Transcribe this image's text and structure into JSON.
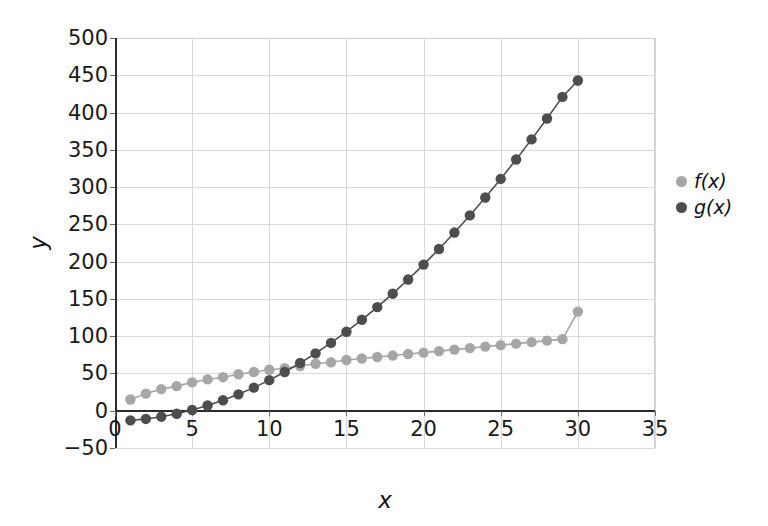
{
  "chart_data": {
    "type": "line",
    "title": "",
    "xlabel": "x",
    "ylabel": "y",
    "xlim": [
      0,
      35
    ],
    "ylim": [
      -50,
      500
    ],
    "xticks": [
      0,
      5,
      10,
      15,
      20,
      25,
      30,
      35
    ],
    "yticks": [
      -50,
      0,
      50,
      100,
      150,
      200,
      250,
      300,
      350,
      400,
      450,
      500
    ],
    "xtick_labels": [
      "0",
      "5",
      "10",
      "15",
      "20",
      "25",
      "30",
      "35"
    ],
    "ytick_labels": [
      "-50",
      "0",
      "50",
      "100",
      "150",
      "200",
      "250",
      "300",
      "350",
      "400",
      "450",
      "500"
    ],
    "grid": true,
    "legend_position": "right",
    "marker": "circle",
    "x": [
      1,
      2,
      3,
      4,
      5,
      6,
      7,
      8,
      9,
      10,
      11,
      12,
      13,
      14,
      15,
      16,
      17,
      18,
      19,
      20,
      21,
      22,
      23,
      24,
      25,
      26,
      27,
      28,
      29,
      30
    ],
    "series": [
      {
        "name": "f(x)",
        "color": "#a6a6a6",
        "values": [
          15,
          23,
          29,
          33,
          38,
          42,
          45,
          49,
          52,
          55,
          57,
          60,
          63,
          65,
          68,
          70,
          72,
          74,
          76,
          78,
          80,
          82,
          84,
          86,
          88,
          90,
          92,
          94,
          96,
          133
        ]
      },
      {
        "name": "g(x)",
        "color": "#4d4d4d",
        "values": [
          -13,
          -11,
          -8,
          -4,
          1,
          7,
          14,
          22,
          31,
          41,
          52,
          64,
          77,
          91,
          106,
          122,
          139,
          157,
          176,
          196,
          217,
          239,
          262,
          286,
          311,
          337,
          364,
          392,
          421,
          443
        ]
      }
    ]
  },
  "legend": {
    "entries": [
      {
        "label": "f(x)",
        "color": "#a6a6a6"
      },
      {
        "label": "g(x)",
        "color": "#4d4d4d"
      }
    ]
  },
  "axes": {
    "x_label": "x",
    "y_label": "y"
  }
}
